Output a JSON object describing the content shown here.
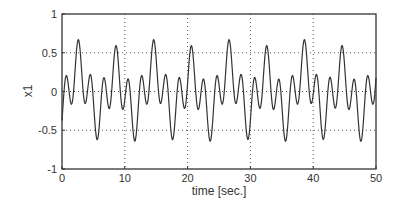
{
  "chart_data": {
    "type": "line",
    "title": "",
    "xlabel": "time [sec.]",
    "ylabel": "x1",
    "xlim": [
      0,
      50
    ],
    "ylim": [
      -1,
      1
    ],
    "xticks": [
      0,
      10,
      20,
      30,
      40,
      50
    ],
    "xtick_labels": [
      "0",
      "10",
      "20",
      "30",
      "40",
      "50"
    ],
    "yticks": [
      -1,
      -0.5,
      0,
      0.5,
      1
    ],
    "ytick_labels": [
      "-1",
      "-0.5",
      "0",
      "0.5",
      "1"
    ],
    "grid": true,
    "legend": null,
    "series": [
      {
        "name": "x1",
        "color": "#333333",
        "model": {
          "description": "approximate: 0.33*sin(pi*(t-0.1)) + 0.3*sin(pi*(t-1.1)/3) with slight drift",
          "components": [
            {
              "amp": 0.33,
              "freq_hz": 0.5,
              "phase_rad": -0.314
            },
            {
              "amp": 0.3,
              "freq_hz": 0.1667,
              "phase_rad": -1.152
            },
            {
              "amp": 0.04,
              "freq_hz": 0.083,
              "phase_rad": 0.0
            }
          ]
        },
        "sample_dt": 0.5,
        "values_first_6s": [
          -0.38,
          0.14,
          0.07,
          -0.19,
          0.14,
          0.61,
          0.38,
          -0.14,
          -0.07,
          0.19,
          -0.14,
          -0.61
        ],
        "observed_extrema": {
          "max": 0.64,
          "min": -0.72,
          "major_peaks_t": [
            2.6,
            8.5,
            14.5,
            20,
            26,
            32,
            38,
            44
          ],
          "major_troughs_t": [
            5.6,
            11.5,
            17.5,
            23.5,
            29.5,
            35,
            41,
            49.8
          ]
        }
      }
    ]
  }
}
